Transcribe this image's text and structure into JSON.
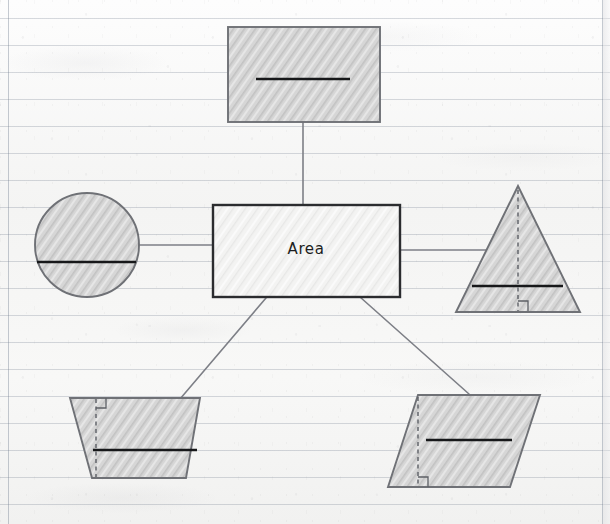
{
  "page": {
    "kind": "handwritten-mind-map",
    "surface": "ruled notebook paper",
    "center_label": "Area",
    "paper_color": "#f7f7f6",
    "rule_line_color": "#7a8494",
    "margin_line_color": "#7a8494",
    "ink_color": "#17181a",
    "shape_stroke_color": "#6f7176",
    "shape_fill_color": "#d8d8d8",
    "connector_color": "#7d7f86"
  },
  "diagram": {
    "title": "Area",
    "center_node": {
      "name": "center-node",
      "label": "Area",
      "shape": "rectangle",
      "x": 213,
      "y": 205,
      "width": 187,
      "height": 92
    },
    "nodes": [
      {
        "id": "rectangle",
        "name": "shape-rectangle",
        "label": "",
        "shape": "rectangle",
        "position": "top",
        "marks": [
          "base-line"
        ],
        "x": 228,
        "y": 27,
        "width": 152,
        "height": 95
      },
      {
        "id": "circle",
        "name": "shape-circle",
        "label": "",
        "shape": "circle",
        "position": "left",
        "marks": [
          "diameter-line"
        ],
        "cx": 87,
        "cy": 245,
        "r": 52
      },
      {
        "id": "triangle",
        "name": "shape-triangle",
        "label": "",
        "shape": "triangle",
        "position": "right",
        "marks": [
          "base-line",
          "height-dashed",
          "right-angle"
        ],
        "apex_x": 518,
        "apex_y": 186,
        "base_y": 312,
        "base_left_x": 456,
        "base_right_x": 580
      },
      {
        "id": "trapezoid",
        "name": "shape-trapezoid",
        "label": "",
        "shape": "trapezoid",
        "position": "bottom-left",
        "marks": [
          "base-line",
          "height-dashed",
          "right-angle"
        ],
        "top_left_x": 70,
        "top_right_x": 200,
        "top_y": 398,
        "bottom_left_x": 92,
        "bottom_right_x": 186,
        "bottom_y": 478
      },
      {
        "id": "parallelogram",
        "name": "shape-parallelogram",
        "label": "",
        "shape": "parallelogram",
        "position": "bottom-right",
        "marks": [
          "base-line",
          "height-dashed",
          "right-angle"
        ],
        "top_left_x": 418,
        "top_right_x": 540,
        "top_y": 395,
        "bottom_left_x": 388,
        "bottom_right_x": 510,
        "bottom_y": 487
      }
    ],
    "connectors": [
      {
        "name": "connector-center-to-rectangle",
        "from": "center-node",
        "to": "rectangle",
        "kind": "vertical",
        "x1": 303,
        "y1": 205,
        "x2": 303,
        "y2": 122
      },
      {
        "name": "connector-center-to-circle",
        "from": "center-node",
        "to": "circle",
        "kind": "horizontal",
        "x1": 213,
        "y1": 245,
        "x2": 137,
        "y2": 245
      },
      {
        "name": "connector-center-to-triangle",
        "from": "center-node",
        "to": "triangle",
        "kind": "horizontal",
        "x1": 400,
        "y1": 250,
        "x2": 486,
        "y2": 250
      },
      {
        "name": "connector-center-to-trapezoid",
        "from": "center-node",
        "to": "trapezoid",
        "kind": "diagonal",
        "x1": 266,
        "y1": 299,
        "x2": 180,
        "y2": 399
      },
      {
        "name": "connector-center-to-parallelogram",
        "from": "center-node",
        "to": "parallelogram",
        "kind": "diagonal",
        "x1": 360,
        "y1": 298,
        "x2": 468,
        "y2": 394
      }
    ]
  }
}
